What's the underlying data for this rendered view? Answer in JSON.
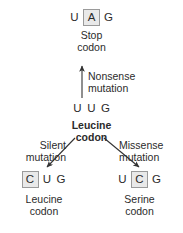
{
  "diagram": {
    "colors": {
      "text": "#2b2b2b",
      "highlight_fill": "#e9e9e9",
      "highlight_border": "#9a9a9a",
      "arrow": "#333333",
      "background": "#ffffff"
    },
    "nodes": {
      "stop": {
        "bases": [
          {
            "letter": "U",
            "highlighted": false
          },
          {
            "letter": "A",
            "highlighted": true
          },
          {
            "letter": "G",
            "highlighted": false
          }
        ],
        "caption_line1": "Stop",
        "caption_line2": "codon",
        "bold": false
      },
      "leucine_original": {
        "bases": [
          {
            "letter": "U",
            "highlighted": false
          },
          {
            "letter": "U",
            "highlighted": false
          },
          {
            "letter": "G",
            "highlighted": false
          }
        ],
        "caption_line1": "Leucine",
        "caption_line2": "codon",
        "bold": true
      },
      "leucine_silent": {
        "bases": [
          {
            "letter": "C",
            "highlighted": true
          },
          {
            "letter": "U",
            "highlighted": false
          },
          {
            "letter": "G",
            "highlighted": false
          }
        ],
        "caption_line1": "Leucine",
        "caption_line2": "codon",
        "bold": false
      },
      "serine": {
        "bases": [
          {
            "letter": "U",
            "highlighted": false
          },
          {
            "letter": "C",
            "highlighted": true
          },
          {
            "letter": "G",
            "highlighted": false
          }
        ],
        "caption_line1": "Serine",
        "caption_line2": "codon",
        "bold": false
      }
    },
    "mutations": {
      "nonsense": {
        "line1": "Nonsense",
        "line2": "mutation"
      },
      "silent": {
        "line1": "Silent",
        "line2": "mutation"
      },
      "missense": {
        "line1": "Missense",
        "line2": "mutation"
      }
    }
  }
}
